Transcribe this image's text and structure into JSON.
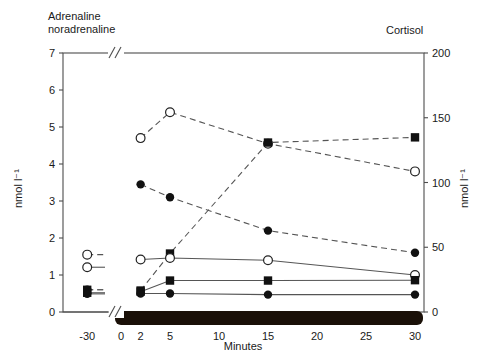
{
  "titles": {
    "left_panel": "Adrenaline\nnoradrenaline",
    "right_panel": "Cortisol",
    "xaxis": "Minutes",
    "yaxis_left": "nmol l⁻¹",
    "yaxis_right": "nmol l⁻¹"
  },
  "chart_data": {
    "type": "line",
    "title": "",
    "subtitle": "",
    "xlabel": "Minutes",
    "ylabel": "nmol l⁻¹",
    "y2label": "nmol l⁻¹",
    "grid": false,
    "legend_position": "none",
    "axis_break": {
      "present": true,
      "between": [
        -30,
        0
      ],
      "axis": "x"
    },
    "infusion_bar": {
      "label": "",
      "from": 0,
      "to": 30,
      "color": "#1a1008"
    },
    "x": [
      -30,
      2,
      5,
      15,
      30
    ],
    "xlim": [
      -30,
      30
    ],
    "xticks": [
      -30,
      0,
      2,
      5,
      10,
      15,
      20,
      25,
      30
    ],
    "xticklabels": [
      "-30",
      "0",
      "2",
      "5",
      "10",
      "15",
      "20",
      "25",
      "30"
    ],
    "ylim": [
      0,
      7
    ],
    "yticks": [
      0,
      1,
      2,
      3,
      4,
      5,
      6,
      7
    ],
    "yticklabels": [
      "0",
      "1",
      "2",
      "3",
      "4",
      "5",
      "6",
      "7"
    ],
    "y2lim": [
      0,
      200
    ],
    "y2ticks": [
      0,
      50,
      100,
      150,
      200
    ],
    "y2ticklabels": [
      "0",
      "50",
      "100",
      "150",
      "200"
    ],
    "series": [
      {
        "name": "open-circle-dashed",
        "marker": "open-circle",
        "line": "dashed",
        "axis": "left",
        "x": [
          -30,
          2,
          5,
          15,
          30
        ],
        "values": [
          1.55,
          4.7,
          5.4,
          4.55,
          3.8
        ]
      },
      {
        "name": "filled-circle-dashed",
        "marker": "filled-circle",
        "line": "dashed",
        "axis": "left",
        "x": [
          -30,
          2,
          5,
          15,
          30
        ],
        "values": [
          0.6,
          3.45,
          3.1,
          2.2,
          1.6
        ]
      },
      {
        "name": "filled-square-dashed",
        "marker": "filled-square",
        "line": "dashed",
        "axis": "left",
        "x": [
          -30,
          2,
          5,
          15,
          30
        ],
        "values": [
          0.6,
          0.58,
          1.58,
          4.58,
          4.72
        ]
      },
      {
        "name": "open-circle-solid",
        "marker": "open-circle",
        "line": "solid",
        "axis": "left",
        "x": [
          -30,
          2,
          5,
          15,
          30
        ],
        "values": [
          1.21,
          1.42,
          1.46,
          1.4,
          1.0
        ]
      },
      {
        "name": "filled-square-solid",
        "marker": "filled-square",
        "line": "solid",
        "axis": "left",
        "x": [
          -30,
          2,
          5,
          15,
          30
        ],
        "values": [
          0.52,
          0.55,
          0.85,
          0.85,
          0.86
        ]
      },
      {
        "name": "filled-circle-solid",
        "marker": "filled-circle",
        "line": "solid",
        "axis": "left",
        "x": [
          -30,
          2,
          5,
          15,
          30
        ],
        "values": [
          0.49,
          0.5,
          0.5,
          0.47,
          0.47
        ]
      }
    ]
  },
  "colors": {
    "axis": "#4d4d4d",
    "marker_fill": "#111111",
    "marker_open": "#ffffff",
    "line": "#555555",
    "bar": "#1a1008",
    "text": "#1a1a1a"
  }
}
